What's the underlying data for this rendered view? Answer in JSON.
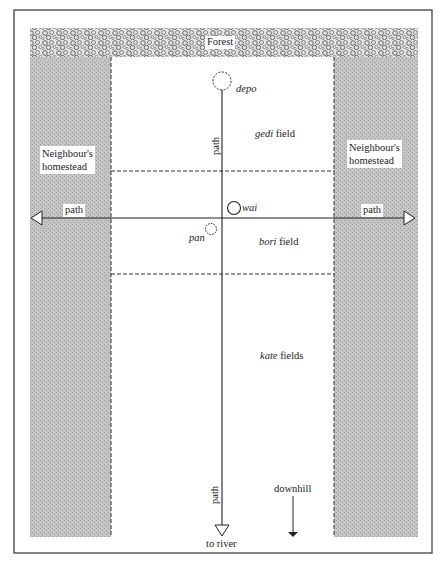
{
  "figure": {
    "forest": {
      "label": "Forest"
    },
    "homesteads": {
      "left": {
        "label_line1": "Neighbour's",
        "label_line2": "homestead"
      },
      "right": {
        "label_line1": "Neighbour's",
        "label_line2": "homestead"
      }
    },
    "paths": {
      "horizontal_left_label": "path",
      "horizontal_right_label": "path",
      "vertical_upper_label": "path",
      "vertical_lower_label": "path",
      "river_label": "to river"
    },
    "features": {
      "depo": "depo",
      "wai": "wai",
      "pan": "pan"
    },
    "fields": {
      "gedi": {
        "name": "gedi",
        "suffix": " field"
      },
      "bori": {
        "name": "bori",
        "suffix": " field"
      },
      "kate": {
        "name": "kate",
        "suffix": " fields"
      }
    },
    "downhill": {
      "label": "downhill"
    },
    "colors": {
      "homestead_fill": "#bdbdbd",
      "forest_fill": "#9a9a9a",
      "line": "#222222",
      "background": "#ffffff"
    }
  }
}
